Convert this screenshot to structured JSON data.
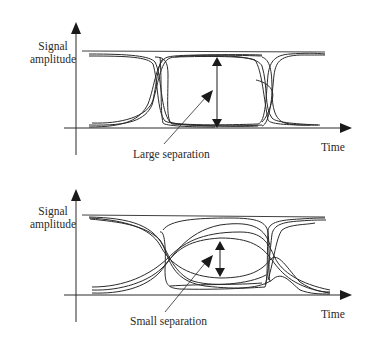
{
  "diagram": {
    "type": "eye-diagram-comparison",
    "panels": [
      {
        "id": "top",
        "y_axis_label_line1": "Signal",
        "y_axis_label_line2": "amplitude",
        "x_axis_label": "Time",
        "annotation": "Large separation",
        "eye_opening": "large"
      },
      {
        "id": "bottom",
        "y_axis_label_line1": "Signal",
        "y_axis_label_line2": "amplitude",
        "x_axis_label": "Time",
        "annotation": "Small separation",
        "eye_opening": "small"
      }
    ],
    "colors": {
      "line": "#2a2a2a",
      "background": "#ffffff"
    }
  }
}
